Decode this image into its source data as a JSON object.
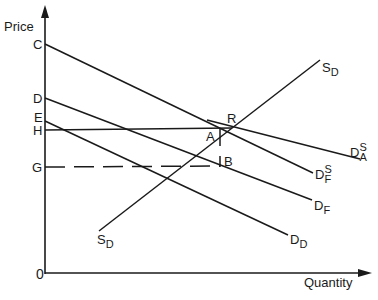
{
  "axes": {
    "y_label": "Price",
    "x_label": "Quantity",
    "origin": "0"
  },
  "price_levels": {
    "C": "C",
    "D": "D",
    "E": "E",
    "H": "H",
    "G": "G"
  },
  "points": {
    "R": "R",
    "A": "A",
    "B": "B"
  },
  "curves": {
    "supply_domestic": {
      "main": "S",
      "sub": "D"
    },
    "demand_domestic": {
      "main": "D",
      "sub": "D"
    },
    "demand_foreign": {
      "main": "D",
      "sub": "F"
    },
    "demand_supply_foreign": {
      "main": "D",
      "sup": "S",
      "sub": "F"
    },
    "demand_supply_all": {
      "main": "D",
      "sup": "S",
      "sub": "A"
    }
  },
  "colors": {
    "line": "#1a1a1a",
    "background": "#ffffff"
  }
}
